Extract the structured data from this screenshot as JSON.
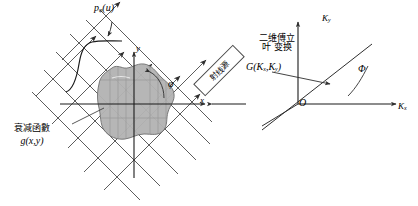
{
  "figure": {
    "type": "diagram",
    "title": "",
    "background_color": "#ffffff",
    "line_color": "#3a3a3a",
    "blob_color": "#b3b3b3",
    "blob_stroke": "#6e6e6e"
  },
  "left_panel": {
    "name": "spatial-domain-panel",
    "projection_label": "p",
    "projection_sub": "φ",
    "projection_arg": "(u)",
    "axis_y": "y",
    "axis_x": "x",
    "angle": "φ",
    "attenuation_line1": "衰减函數",
    "attenuation_line2": "g(x,y)",
    "ray_grid": {
      "angle_deg": 45,
      "ray_count": 7,
      "crossbar_count": 6,
      "arrowheads": "true"
    }
  },
  "connector": {
    "name": "source-box",
    "label": "射线源",
    "rotation_deg": -45
  },
  "right_panel": {
    "name": "frequency-domain-panel",
    "transform_line1": "二维傅立",
    "transform_line2": "叶 变换",
    "function_label": "G(",
    "function_kx": "K",
    "function_kx_sub": "x",
    "function_comma": ",",
    "function_ky": "K",
    "function_ky_sub": "y",
    "function_close": ")",
    "axis_ky": "K",
    "axis_ky_sub": "y",
    "axis_kx": "K",
    "axis_kx_sub": "x",
    "origin": "O",
    "angle": "Φ"
  }
}
